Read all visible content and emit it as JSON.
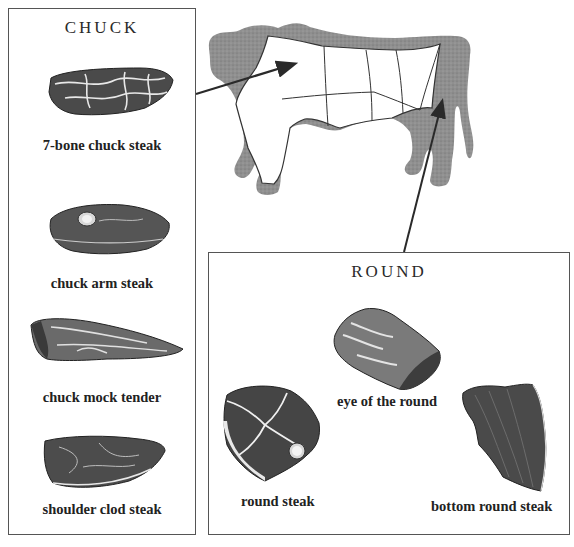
{
  "diagram": {
    "cow_regions": [
      "chuck",
      "rib",
      "loin",
      "sirloin",
      "round",
      "brisket",
      "plate",
      "flank"
    ],
    "colors": {
      "cow_body": "#8e8e8e",
      "box_border": "#555555",
      "arrow": "#2a2a2a",
      "text": "#222222"
    }
  },
  "chuck": {
    "title": "CHUCK",
    "cuts": [
      {
        "label": "7-bone chuck steak"
      },
      {
        "label": "chuck arm steak"
      },
      {
        "label": "chuck mock tender"
      },
      {
        "label": "shoulder clod steak"
      }
    ]
  },
  "round": {
    "title": "ROUND",
    "cuts": [
      {
        "label": "eye of the round"
      },
      {
        "label": "round steak"
      },
      {
        "label": "bottom round steak"
      }
    ]
  }
}
